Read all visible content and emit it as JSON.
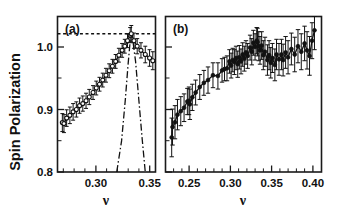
{
  "figure": {
    "y_axis_title": "Spin Polarization",
    "panels": [
      {
        "label": "(a)",
        "x_axis_title": "ν",
        "x_ticks": [
          "0.30",
          "0.35"
        ],
        "y_ticks": [
          "0.8",
          "0.9",
          "1.0"
        ]
      },
      {
        "label": "(b)",
        "x_axis_title": "ν",
        "x_ticks": [
          "0.25",
          "0.30",
          "0.35",
          "0.40"
        ],
        "y_ticks": [
          "0.8",
          "0.9",
          "1.0"
        ]
      }
    ]
  },
  "chart_data": [
    {
      "type": "scatter",
      "panel": "(a)",
      "title": "",
      "xlabel": "ν",
      "ylabel": "Spin Polarization",
      "xlim": [
        0.2645,
        0.3555
      ],
      "ylim": [
        0.8,
        1.025
      ],
      "xticks": [
        0.3,
        0.35
      ],
      "xticks_minor_step": 0.01,
      "yticks": [
        0.8,
        0.9,
        1.0
      ],
      "grid": false,
      "legend": null,
      "marker": "open-circle",
      "connected_by_line": true,
      "series": [
        {
          "name": "measured spin polarization",
          "x": [
            0.269,
            0.2705,
            0.273,
            0.276,
            0.279,
            0.282,
            0.285,
            0.288,
            0.291,
            0.294,
            0.2975,
            0.3005,
            0.3035,
            0.3065,
            0.3095,
            0.3125,
            0.3155,
            0.3185,
            0.3215,
            0.3245,
            0.327,
            0.3295,
            0.332,
            0.333,
            0.3355,
            0.3385,
            0.342,
            0.346,
            0.35,
            0.353
          ],
          "y": [
            0.8715,
            0.87,
            0.878,
            0.882,
            0.887,
            0.8905,
            0.896,
            0.899,
            0.903,
            0.9085,
            0.915,
            0.9215,
            0.927,
            0.933,
            0.94,
            0.9465,
            0.953,
            0.96,
            0.969,
            0.976,
            0.982,
            0.99,
            0.998,
            1.0,
            0.99,
            0.982,
            0.976,
            0.97,
            0.965,
            0.961
          ],
          "yerr": [
            0.013,
            0.013,
            0.012,
            0.012,
            0.012,
            0.011,
            0.011,
            0.011,
            0.011,
            0.011,
            0.01,
            0.01,
            0.01,
            0.01,
            0.01,
            0.01,
            0.01,
            0.01,
            0.01,
            0.01,
            0.01,
            0.01,
            0.011,
            0.012,
            0.011,
            0.011,
            0.011,
            0.012,
            0.012,
            0.013
          ]
        }
      ],
      "annotations": [
        {
          "name": "unity-reference-line",
          "type": "horizontal-dotted-line",
          "y": 1.0,
          "x_start": 0.2645,
          "x_end": 0.3555
        },
        {
          "name": "theoretical-dash-dot-curve",
          "type": "dash-dot-curve",
          "x": [
            0.3195,
            0.324,
            0.3275,
            0.33,
            0.332,
            0.333,
            0.3345,
            0.337,
            0.34,
            0.343,
            0.346
          ],
          "y": [
            0.8,
            0.845,
            0.905,
            0.955,
            0.99,
            1.0,
            0.99,
            0.96,
            0.905,
            0.85,
            0.8
          ]
        }
      ]
    },
    {
      "type": "scatter",
      "panel": "(b)",
      "title": "",
      "xlabel": "ν",
      "ylabel": "Spin Polarization",
      "xlim": [
        0.2215,
        0.4105
      ],
      "ylim": [
        0.8,
        1.025
      ],
      "xticks": [
        0.25,
        0.3,
        0.35,
        0.4
      ],
      "xticks_minor_step": 0.01,
      "yticks": [
        0.8,
        0.9,
        1.0
      ],
      "grid": false,
      "legend": null,
      "marker": "filled-circle",
      "connected_by_line": true,
      "series": [
        {
          "name": "measured spin polarization",
          "x": [
            0.229,
            0.23,
            0.233,
            0.236,
            0.24,
            0.244,
            0.248,
            0.25,
            0.251,
            0.254,
            0.258,
            0.263,
            0.268,
            0.273,
            0.279,
            0.285,
            0.29,
            0.293,
            0.296,
            0.299,
            0.301,
            0.303,
            0.305,
            0.307,
            0.309,
            0.311,
            0.313,
            0.315,
            0.317,
            0.319,
            0.321,
            0.324,
            0.326,
            0.328,
            0.33,
            0.332,
            0.333,
            0.3345,
            0.336,
            0.338,
            0.34,
            0.342,
            0.345,
            0.347,
            0.349,
            0.351,
            0.354,
            0.356,
            0.359,
            0.362,
            0.364,
            0.367,
            0.37,
            0.374,
            0.378,
            0.382,
            0.386,
            0.39,
            0.393,
            0.396,
            0.399,
            0.402
          ],
          "y": [
            0.85,
            0.865,
            0.872,
            0.883,
            0.888,
            0.893,
            0.902,
            0.903,
            0.898,
            0.908,
            0.915,
            0.923,
            0.929,
            0.933,
            0.94,
            0.939,
            0.947,
            0.949,
            0.95,
            0.96,
            0.954,
            0.962,
            0.959,
            0.965,
            0.956,
            0.966,
            0.96,
            0.97,
            0.964,
            0.973,
            0.968,
            0.98,
            0.974,
            0.987,
            0.981,
            0.99,
            0.988,
            0.982,
            0.976,
            0.983,
            0.969,
            0.974,
            0.962,
            0.969,
            0.958,
            0.965,
            0.955,
            0.97,
            0.963,
            0.97,
            0.962,
            0.973,
            0.966,
            0.978,
            0.97,
            0.982,
            0.974,
            0.986,
            0.976,
            0.968,
            0.99,
            1.005
          ],
          "yerr": [
            0.028,
            0.026,
            0.024,
            0.022,
            0.021,
            0.02,
            0.019,
            0.02,
            0.022,
            0.019,
            0.018,
            0.018,
            0.018,
            0.019,
            0.018,
            0.019,
            0.017,
            0.017,
            0.018,
            0.017,
            0.018,
            0.017,
            0.018,
            0.017,
            0.019,
            0.017,
            0.018,
            0.017,
            0.018,
            0.017,
            0.018,
            0.018,
            0.019,
            0.018,
            0.019,
            0.019,
            0.02,
            0.021,
            0.02,
            0.02,
            0.021,
            0.021,
            0.022,
            0.021,
            0.022,
            0.021,
            0.023,
            0.022,
            0.023,
            0.022,
            0.023,
            0.023,
            0.024,
            0.023,
            0.025,
            0.024,
            0.026,
            0.025,
            0.027,
            0.028,
            0.026,
            0.028
          ]
        }
      ],
      "annotations": []
    }
  ]
}
